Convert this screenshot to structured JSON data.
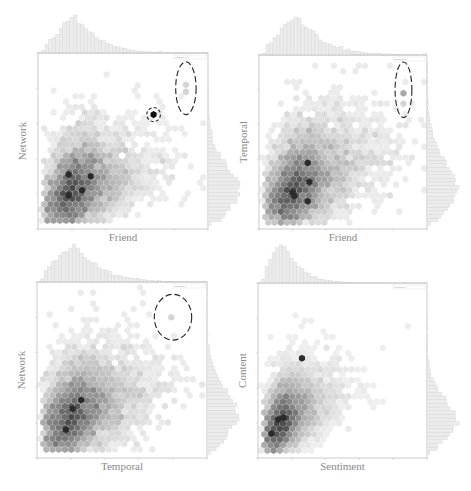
{
  "chart_data": [
    {
      "type": "heatmap",
      "subtype": "hexbin-jointplot",
      "xlabel": "Friend",
      "ylabel": "Network",
      "xlim": [
        0,
        1
      ],
      "ylim": [
        0,
        1
      ],
      "annotation": "pearsonr; p",
      "grid": false,
      "marginal_histograms": [
        "top",
        "right"
      ],
      "density_center": [
        0.22,
        0.23
      ],
      "density_spread": [
        0.11,
        0.13
      ],
      "correlation": 0.45,
      "hot_spots": [
        [
          0.18,
          0.19
        ],
        [
          0.26,
          0.22
        ],
        [
          0.31,
          0.3
        ],
        [
          0.18,
          0.31
        ]
      ],
      "outliers": [
        {
          "x": 0.68,
          "y": 0.65,
          "marked": "circle",
          "shade": "dark"
        },
        {
          "x": 0.87,
          "y": 0.82,
          "marked": "ellipse",
          "shade": "light"
        },
        {
          "x": 0.87,
          "y": 0.78,
          "marked": "ellipse",
          "shade": "light"
        }
      ],
      "marked_regions": [
        {
          "shape": "circle",
          "cx": 0.68,
          "cy": 0.65,
          "rx": 0.04,
          "ry": 0.04
        },
        {
          "shape": "ellipse",
          "cx": 0.87,
          "cy": 0.8,
          "rx": 0.06,
          "ry": 0.15
        }
      ]
    },
    {
      "type": "heatmap",
      "subtype": "hexbin-jointplot",
      "xlabel": "Friend",
      "ylabel": "Temporal",
      "xlim": [
        0,
        1
      ],
      "ylim": [
        0,
        1
      ],
      "annotation": "pearsonr; p",
      "grid": false,
      "marginal_histograms": [
        "top",
        "right"
      ],
      "density_center": [
        0.23,
        0.25
      ],
      "density_spread": [
        0.12,
        0.15
      ],
      "correlation": 0.5,
      "hot_spots": [
        [
          0.29,
          0.38
        ],
        [
          0.2,
          0.21
        ],
        [
          0.3,
          0.27
        ],
        [
          0.21,
          0.19
        ],
        [
          0.29,
          0.16
        ]
      ],
      "outliers": [
        {
          "x": 0.86,
          "y": 0.78,
          "marked": "ellipse",
          "shade": "medium"
        },
        {
          "x": 0.86,
          "y": 0.72,
          "marked": "ellipse",
          "shade": "light"
        },
        {
          "x": 0.69,
          "y": 0.54,
          "marked": "none",
          "shade": "light"
        }
      ],
      "marked_regions": [
        {
          "shape": "ellipse",
          "cx": 0.86,
          "cy": 0.8,
          "rx": 0.05,
          "ry": 0.16
        }
      ]
    },
    {
      "type": "heatmap",
      "subtype": "hexbin-jointplot",
      "xlabel": "Temporal",
      "ylabel": "Network",
      "xlim": [
        0,
        1
      ],
      "ylim": [
        0,
        1
      ],
      "annotation": "pearsonr; p",
      "grid": false,
      "marginal_histograms": [
        "top",
        "right"
      ],
      "density_center": [
        0.22,
        0.25
      ],
      "density_spread": [
        0.12,
        0.14
      ],
      "correlation": 0.45,
      "hot_spots": [
        [
          0.21,
          0.28
        ],
        [
          0.17,
          0.16
        ],
        [
          0.26,
          0.33
        ]
      ],
      "outliers": [
        {
          "x": 0.79,
          "y": 0.8,
          "marked": "ellipse",
          "shade": "light"
        },
        {
          "x": 0.51,
          "y": 0.63,
          "marked": "none",
          "shade": "light"
        }
      ],
      "marked_regions": [
        {
          "shape": "ellipse",
          "cx": 0.8,
          "cy": 0.8,
          "rx": 0.11,
          "ry": 0.13
        }
      ]
    },
    {
      "type": "heatmap",
      "subtype": "hexbin-jointplot",
      "xlabel": "Sentiment",
      "ylabel": "Content",
      "xlim": [
        0,
        1
      ],
      "ylim": [
        0,
        1
      ],
      "annotation": "pearsonr; p",
      "grid": false,
      "marginal_histograms": [
        "top",
        "right"
      ],
      "density_center": [
        0.15,
        0.22
      ],
      "density_spread": [
        0.08,
        0.12
      ],
      "correlation": 0.55,
      "hot_spots": [
        [
          0.12,
          0.22
        ],
        [
          0.15,
          0.23
        ],
        [
          0.08,
          0.14
        ],
        [
          0.26,
          0.57
        ]
      ],
      "outliers": [],
      "marked_regions": []
    }
  ]
}
